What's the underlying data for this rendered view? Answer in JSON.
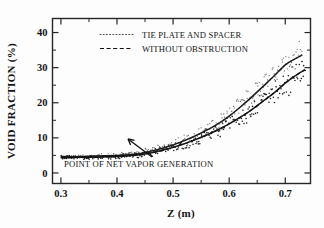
{
  "chart_data": {
    "type": "scatter",
    "title": "",
    "xlabel": "Z   (m)",
    "ylabel": "VOID FRACTION   (%)",
    "xlim": [
      0.285,
      0.745
    ],
    "ylim": [
      -3,
      44
    ],
    "grid": false,
    "x_ticks": [
      0.3,
      0.4,
      0.5,
      0.6,
      0.7
    ],
    "x_tick_labels": [
      "0.3",
      "0.4",
      "0.5",
      "0.6",
      "0.7"
    ],
    "x_minor_ticks": [
      0.35,
      0.45,
      0.55,
      0.65
    ],
    "y_ticks": [
      0,
      10,
      20,
      30,
      40
    ],
    "y_tick_labels": [
      "0",
      "10",
      "20",
      "30",
      "40"
    ],
    "y_minor_ticks": [
      5,
      15,
      25,
      35
    ],
    "legend_position": "upper-left",
    "annotations": [
      {
        "text": "POINT OF NET VAPOR GENERATION",
        "points_to_x": 0.44,
        "points_to_y": 5.2
      }
    ],
    "series": [
      {
        "name": "TIE PLATE AND SPACER",
        "style": "dotted",
        "x": [
          0.3,
          0.32,
          0.34,
          0.36,
          0.38,
          0.4,
          0.42,
          0.44,
          0.46,
          0.48,
          0.5,
          0.52,
          0.54,
          0.56,
          0.58,
          0.6,
          0.62,
          0.64,
          0.66,
          0.68,
          0.7,
          0.715,
          0.73
        ],
        "y": [
          4.6,
          4.6,
          4.7,
          4.8,
          4.9,
          5.0,
          5.2,
          5.5,
          6.2,
          7.0,
          8.0,
          9.2,
          10.6,
          12.2,
          14.0,
          16.2,
          18.8,
          21.6,
          24.6,
          27.6,
          30.8,
          32.3,
          33.6
        ]
      },
      {
        "name": "WITHOUT OBSTRUCTION",
        "style": "dashed",
        "x": [
          0.3,
          0.32,
          0.34,
          0.36,
          0.38,
          0.4,
          0.42,
          0.44,
          0.46,
          0.48,
          0.5,
          0.52,
          0.54,
          0.56,
          0.58,
          0.6,
          0.62,
          0.64,
          0.66,
          0.68,
          0.7,
          0.715,
          0.735
        ],
        "y": [
          4.4,
          4.4,
          4.5,
          4.5,
          4.6,
          4.7,
          4.9,
          5.2,
          5.7,
          6.4,
          7.3,
          8.3,
          9.5,
          10.8,
          12.3,
          14.0,
          15.9,
          18.0,
          20.4,
          22.8,
          25.6,
          27.4,
          29.4
        ]
      }
    ]
  },
  "legend": {
    "entries": [
      {
        "label": "TIE PLATE AND SPACER",
        "style": "dotted"
      },
      {
        "label": "WITHOUT OBSTRUCTION",
        "style": "dashed"
      }
    ]
  },
  "axes": {
    "x_title": "Z   (m)",
    "y_title": "VOID FRACTION   (%)",
    "x_labels": [
      "0.3",
      "0.4",
      "0.5",
      "0.6",
      "0.7"
    ],
    "y_labels": [
      "0",
      "10",
      "20",
      "30",
      "40"
    ]
  },
  "annotation": {
    "label": "POINT OF NET VAPOR GENERATION"
  }
}
